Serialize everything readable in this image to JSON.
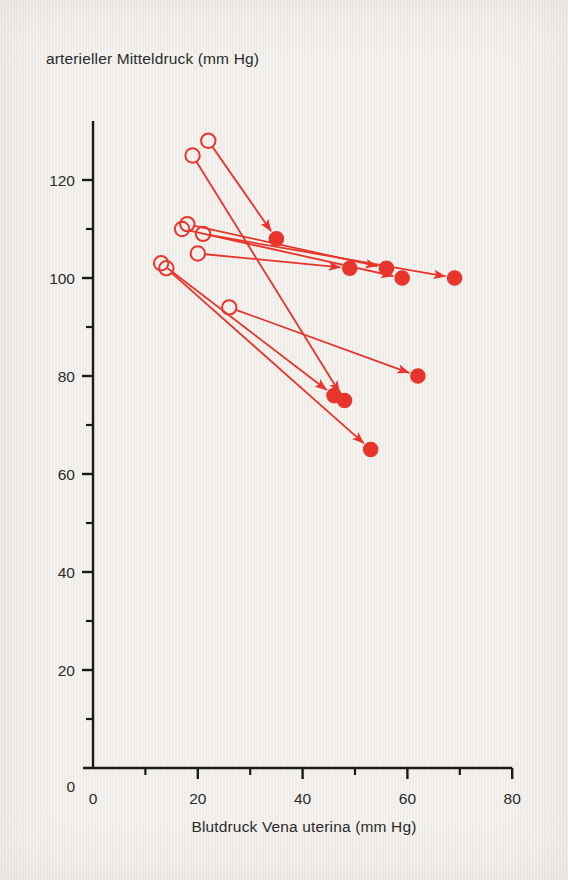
{
  "chart_data": {
    "type": "scatter",
    "title": "",
    "ylabel": "arterieller Mitteldruck (mm Hg)",
    "xlabel": "Blutdruck Vena uterina (mm Hg)",
    "xlim": [
      0,
      80
    ],
    "ylim": [
      0,
      130
    ],
    "xticks": [
      0,
      20,
      40,
      60,
      80
    ],
    "xticklabels": [
      "0",
      "20",
      "40",
      "60",
      "80"
    ],
    "xminorticks": [
      10,
      30,
      50,
      70
    ],
    "yticks": [
      0,
      20,
      40,
      60,
      80,
      100,
      120
    ],
    "yticklabels": [
      "0",
      "20",
      "40",
      "60",
      "80",
      "100",
      "120"
    ],
    "yminorticks": [
      10,
      30,
      50,
      70,
      90,
      110
    ],
    "grid": false,
    "legend": "none",
    "accent_color": "#e8352b",
    "series": [
      {
        "name": "vorher (offene Kreise)",
        "marker": "open-circle",
        "points": [
          {
            "x": 22,
            "y": 128
          },
          {
            "x": 19,
            "y": 125
          },
          {
            "x": 18,
            "y": 111
          },
          {
            "x": 17,
            "y": 110
          },
          {
            "x": 21,
            "y": 109
          },
          {
            "x": 20,
            "y": 105
          },
          {
            "x": 13,
            "y": 103
          },
          {
            "x": 14,
            "y": 102
          },
          {
            "x": 26,
            "y": 94
          }
        ]
      },
      {
        "name": "nachher (gefuellte Kreise)",
        "marker": "filled-circle",
        "points": [
          {
            "x": 35,
            "y": 108
          },
          {
            "x": 49,
            "y": 102
          },
          {
            "x": 56,
            "y": 102
          },
          {
            "x": 59,
            "y": 100
          },
          {
            "x": 69,
            "y": 100
          },
          {
            "x": 46,
            "y": 76
          },
          {
            "x": 48,
            "y": 75
          },
          {
            "x": 62,
            "y": 80
          },
          {
            "x": 53,
            "y": 65
          }
        ]
      }
    ],
    "arrows": [
      {
        "from": {
          "x": 22,
          "y": 128
        },
        "to": {
          "x": 35,
          "y": 108
        }
      },
      {
        "from": {
          "x": 19,
          "y": 125
        },
        "to": {
          "x": 48,
          "y": 75
        }
      },
      {
        "from": {
          "x": 18,
          "y": 111
        },
        "to": {
          "x": 56,
          "y": 102
        }
      },
      {
        "from": {
          "x": 17,
          "y": 110
        },
        "to": {
          "x": 59,
          "y": 100
        }
      },
      {
        "from": {
          "x": 21,
          "y": 109
        },
        "to": {
          "x": 69,
          "y": 100
        }
      },
      {
        "from": {
          "x": 20,
          "y": 105
        },
        "to": {
          "x": 49,
          "y": 102
        }
      },
      {
        "from": {
          "x": 13,
          "y": 103
        },
        "to": {
          "x": 46,
          "y": 76
        }
      },
      {
        "from": {
          "x": 14,
          "y": 102
        },
        "to": {
          "x": 53,
          "y": 65
        }
      },
      {
        "from": {
          "x": 26,
          "y": 94
        },
        "to": {
          "x": 62,
          "y": 80
        }
      }
    ]
  }
}
